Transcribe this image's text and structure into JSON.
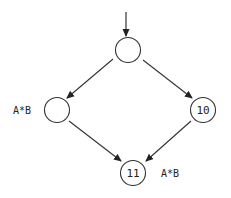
{
  "diagram": {
    "type": "control-flow-graph",
    "nodes": [
      {
        "id": "top",
        "label": "",
        "cx": 128,
        "cy": 50
      },
      {
        "id": "left",
        "label": "",
        "cx": 57,
        "cy": 110
      },
      {
        "id": "right",
        "label": "10",
        "cx": 203,
        "cy": 110
      },
      {
        "id": "bottom",
        "label": "11",
        "cx": 133,
        "cy": 173
      }
    ],
    "edges": [
      {
        "from": "entry",
        "to": "top"
      },
      {
        "from": "top",
        "to": "left"
      },
      {
        "from": "top",
        "to": "right"
      },
      {
        "from": "left",
        "to": "bottom"
      },
      {
        "from": "right",
        "to": "bottom"
      }
    ],
    "annotations": [
      {
        "text": "A*B",
        "near": "left"
      },
      {
        "text": "A*B",
        "near": "bottom"
      }
    ],
    "stroke_color": "#333333"
  }
}
